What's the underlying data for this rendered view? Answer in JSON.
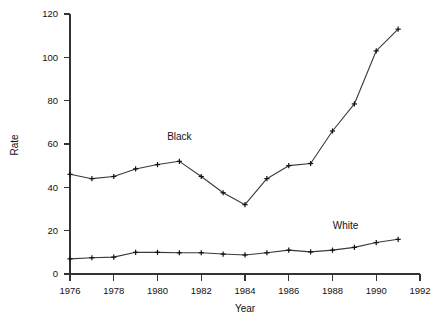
{
  "chart_data": {
    "type": "line",
    "title": "",
    "xlabel": "Year",
    "ylabel": "Rate",
    "xlim": [
      1976,
      1992
    ],
    "ylim": [
      0,
      120
    ],
    "xticks": [
      1976,
      1978,
      1980,
      1982,
      1984,
      1986,
      1988,
      1990,
      1992
    ],
    "yticks": [
      0,
      20,
      40,
      60,
      80,
      100,
      120
    ],
    "grid": false,
    "legend_position": "inline-annotations",
    "marker": "plus",
    "x": [
      1976,
      1977,
      1978,
      1979,
      1980,
      1981,
      1982,
      1983,
      1984,
      1985,
      1986,
      1987,
      1988,
      1989,
      1990,
      1991
    ],
    "series": [
      {
        "name": "Black",
        "label_x": 1981,
        "label_y": 62,
        "values": [
          46,
          44,
          45,
          48.5,
          50.5,
          52,
          45,
          37.5,
          32,
          44,
          50,
          51,
          66,
          78.5,
          103,
          113
        ]
      },
      {
        "name": "White",
        "label_x": 1988.6,
        "label_y": 21,
        "values": [
          7,
          7.5,
          7.8,
          10,
          10,
          9.8,
          9.8,
          9.2,
          8.8,
          9.8,
          11,
          10.2,
          11,
          12.3,
          14.5,
          16
        ]
      }
    ]
  },
  "axis_labels": {
    "x_title": "Year",
    "y_title": "Rate"
  }
}
